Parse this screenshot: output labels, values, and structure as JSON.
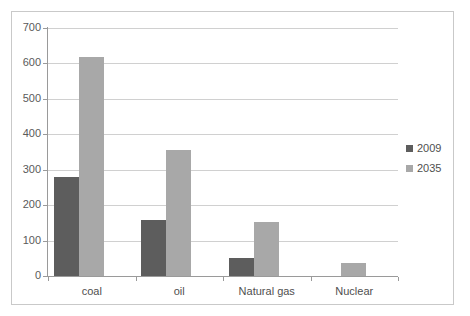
{
  "chart_data": {
    "type": "bar",
    "title": "",
    "subtitle": "",
    "xlabel": "",
    "ylabel": "",
    "categories": [
      "coal",
      "oil",
      "Natural gas",
      "Nuclear"
    ],
    "series": [
      {
        "name": "2009",
        "color": "#5d5d5d",
        "values": [
          280,
          158,
          50,
          0
        ]
      },
      {
        "name": "2035",
        "color": "#a8a8a8",
        "values": [
          618,
          355,
          152,
          38
        ]
      }
    ],
    "ylim": [
      0,
      700
    ],
    "ytick_values": [
      0,
      100,
      200,
      300,
      400,
      500,
      600,
      700
    ],
    "ytick_labels": [
      "0",
      "100",
      "200",
      "300",
      "400",
      "500",
      "600",
      "700"
    ],
    "grid": true,
    "grid_axis": "y",
    "legend": [
      "2009",
      "2035"
    ],
    "legend_position": "right"
  },
  "legend": {
    "entries": [
      {
        "label": "2009",
        "swatch": "legend-swatch-2009"
      },
      {
        "label": "2035",
        "swatch": "legend-swatch-2035"
      }
    ]
  },
  "colors": {
    "series_2009": "#5d5d5d",
    "series_2035": "#a8a8a8",
    "gridline": "#d0d0d0",
    "axis": "#9a9a9a",
    "frame_border": "#c9c9c9",
    "tick_label": "#5a5a5a",
    "background": "#ffffff"
  }
}
